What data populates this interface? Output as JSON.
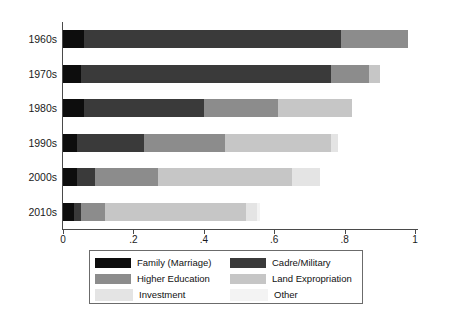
{
  "chart_data": {
    "type": "bar",
    "orientation": "horizontal",
    "stacked": true,
    "title": "",
    "xlabel": "",
    "ylabel": "",
    "xlim": [
      0,
      1
    ],
    "grid": false,
    "legend_position": "bottom",
    "categories": [
      "1960s",
      "1970s",
      "1980s",
      "1990s",
      "2000s",
      "2010s"
    ],
    "xticks": [
      "0",
      ".2",
      ".4",
      ".6",
      ".8",
      "1"
    ],
    "xtick_values": [
      0,
      0.2,
      0.4,
      0.6,
      0.8,
      1
    ],
    "series": [
      {
        "name": "Family (Marriage)",
        "color": "#0d0d0d",
        "values": [
          0.06,
          0.05,
          0.06,
          0.04,
          0.04,
          0.03
        ]
      },
      {
        "name": "Cadre/Military",
        "color": "#3a3a3a",
        "values": [
          0.73,
          0.71,
          0.34,
          0.19,
          0.05,
          0.02
        ]
      },
      {
        "name": "Higher Education",
        "color": "#8c8c8c",
        "values": [
          0.19,
          0.11,
          0.21,
          0.23,
          0.18,
          0.07
        ]
      },
      {
        "name": "Land Expropriation",
        "color": "#c6c6c6",
        "values": [
          0.0,
          0.03,
          0.21,
          0.3,
          0.38,
          0.4
        ]
      },
      {
        "name": "Investment",
        "color": "#e4e4e4",
        "values": [
          0.0,
          0.0,
          0.0,
          0.02,
          0.08,
          0.03
        ]
      },
      {
        "name": "Other",
        "color": "#f3f3f3",
        "values": [
          0.0,
          0.0,
          0.0,
          0.0,
          0.0,
          0.01
        ]
      }
    ],
    "row_totals": [
      0.98,
      0.9,
      0.82,
      0.78,
      0.73,
      0.56
    ]
  },
  "legend": {
    "entries": [
      {
        "label": "Family (Marriage)",
        "color": "#0d0d0d"
      },
      {
        "label": "Cadre/Military",
        "color": "#3a3a3a"
      },
      {
        "label": "Higher Education",
        "color": "#8c8c8c"
      },
      {
        "label": "Land Expropriation",
        "color": "#c6c6c6"
      },
      {
        "label": "Investment",
        "color": "#e4e4e4"
      },
      {
        "label": "Other",
        "color": "#f3f3f3"
      }
    ]
  },
  "axis": {
    "axis_color": "#4a4a4a",
    "tick_label_color": "#1a1a1a"
  }
}
